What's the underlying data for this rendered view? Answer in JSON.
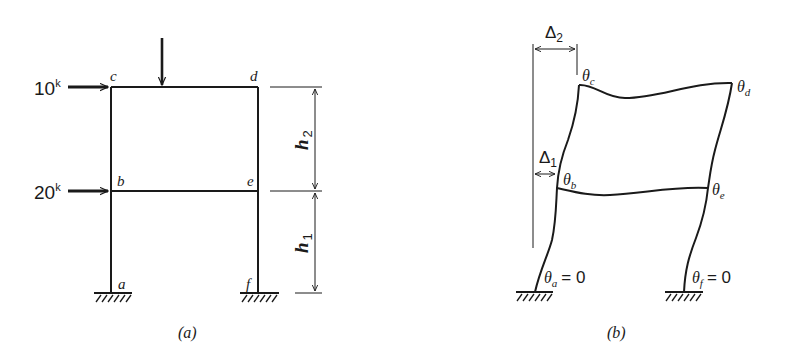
{
  "figure_a": {
    "caption": "(a)",
    "loads": [
      {
        "label_value": "10",
        "label_unit": "k",
        "node": "c",
        "direction": "horizontal-right"
      },
      {
        "label_value": "20",
        "label_unit": "k",
        "node": "b",
        "direction": "horizontal-right"
      },
      {
        "label_value": "",
        "node": "beam-cd",
        "direction": "vertical-down"
      }
    ],
    "nodes": {
      "a": "a",
      "b": "b",
      "c": "c",
      "d": "d",
      "e": "e",
      "f": "f"
    },
    "dimensions": [
      {
        "symbol": "h",
        "subscript": "2",
        "span": "upper story"
      },
      {
        "symbol": "h",
        "subscript": "1",
        "span": "lower story"
      }
    ],
    "supports": [
      "fixed-a",
      "fixed-f"
    ]
  },
  "figure_b": {
    "caption": "(b)",
    "displacements": [
      {
        "symbol": "Δ",
        "subscript": "2",
        "level": "upper"
      },
      {
        "symbol": "Δ",
        "subscript": "1",
        "level": "lower"
      }
    ],
    "rotations": {
      "c": {
        "symbol": "θ",
        "subscript": "c"
      },
      "d": {
        "symbol": "θ",
        "subscript": "d"
      },
      "b": {
        "symbol": "θ",
        "subscript": "b"
      },
      "e": {
        "symbol": "θ",
        "subscript": "e"
      },
      "a": {
        "symbol": "θ",
        "subscript": "a",
        "equals": "= 0"
      },
      "f": {
        "symbol": "θ",
        "subscript": "f",
        "equals": "= 0"
      }
    },
    "supports": [
      "fixed-a",
      "fixed-f"
    ]
  }
}
